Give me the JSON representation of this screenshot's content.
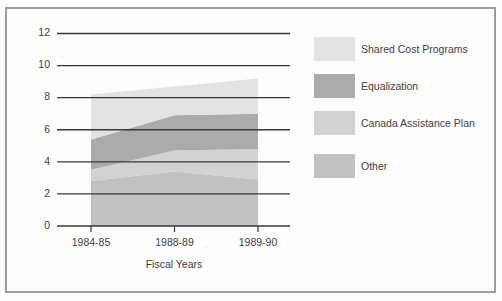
{
  "chart_data": {
    "type": "area",
    "stacked": true,
    "title": "",
    "xlabel": "Fiscal Years",
    "ylabel": "",
    "categories": [
      "1984-85",
      "1988-89",
      "1989-90"
    ],
    "series": [
      {
        "name": "Shared Cost Programs",
        "color": "#e3e3e3",
        "values": [
          2.8,
          1.8,
          2.2
        ]
      },
      {
        "name": "Equalization",
        "color": "#ababab",
        "values": [
          1.9,
          2.2,
          2.2
        ]
      },
      {
        "name": "Canada Assistance Plan",
        "color": "#d2d2d2",
        "values": [
          0.7,
          1.3,
          1.9
        ]
      },
      {
        "name": "Other",
        "color": "#c1c1c1",
        "values": [
          2.8,
          3.4,
          2.9
        ]
      }
    ],
    "ylim": [
      0,
      12
    ],
    "yticks": [
      0,
      2,
      4,
      6,
      8,
      10,
      12
    ],
    "grid": true,
    "legend_position": "right",
    "axis_color": "#383838",
    "text_color": "#3f3f3f"
  }
}
